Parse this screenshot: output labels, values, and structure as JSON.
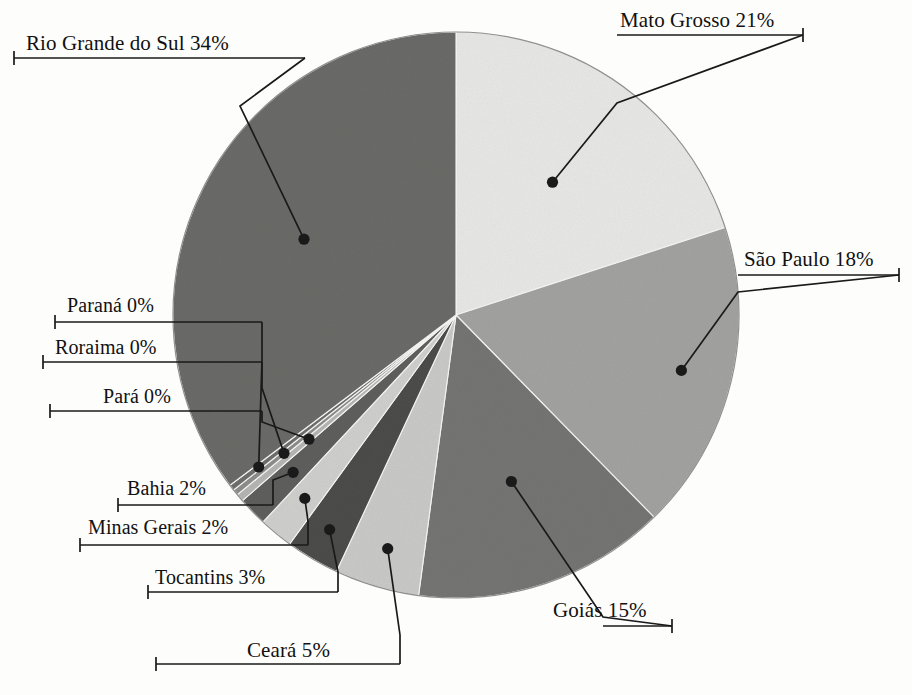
{
  "chart_data": {
    "type": "pie",
    "title": "",
    "subtitle": "",
    "xlabel": "",
    "ylabel": "",
    "legend_position": "none",
    "grid": false,
    "units": "percent",
    "label_format": "{name} {value}%",
    "start_angle_deg": 0,
    "direction": "clockwise",
    "center": {
      "x": 456,
      "y": 315
    },
    "radius": 283,
    "categories": [
      "Mato Grosso",
      "São Paulo",
      "Goiás",
      "Ceará",
      "Tocantins",
      "Minas Gerais",
      "Bahia",
      "Pará",
      "Roraima",
      "Paraná",
      "Rio Grande do Sul"
    ],
    "values": [
      21,
      18,
      15,
      5,
      3,
      2,
      2,
      0,
      0,
      0,
      34
    ],
    "colors": [
      "#e7e7e5",
      "#a2a2a0",
      "#757573",
      "#c9c9c7",
      "#4c4c4a",
      "#cfcfcd",
      "#5f5f5d",
      "#b5b5b3",
      "#8d8d8b",
      "#6e6e6c",
      "#6a6a68"
    ],
    "slices": [
      {
        "name": "Mato Grosso",
        "value": 21,
        "label": "Mato Grosso 21%",
        "color": "#e7e7e5",
        "sweep_deg": 72.0,
        "start_deg": 0.0
      },
      {
        "name": "São Paulo",
        "value": 18,
        "label": "São Paulo 18%",
        "color": "#a2a2a0",
        "sweep_deg": 63.6,
        "start_deg": 72.0
      },
      {
        "name": "Goiás",
        "value": 15,
        "label": "Goiás 15%",
        "color": "#757573",
        "sweep_deg": 52.0,
        "start_deg": 135.6
      },
      {
        "name": "Ceará",
        "value": 5,
        "label": "Ceará 5%",
        "color": "#c9c9c7",
        "sweep_deg": 17.4,
        "start_deg": 187.6
      },
      {
        "name": "Tocantins",
        "value": 3,
        "label": "Tocantins 3%",
        "color": "#4c4c4a",
        "sweep_deg": 11.0,
        "start_deg": 205.0
      },
      {
        "name": "Minas Gerais",
        "value": 2,
        "label": "Minas Gerais 2%",
        "color": "#cfcfcd",
        "sweep_deg": 7.0,
        "start_deg": 216.0
      },
      {
        "name": "Bahia",
        "value": 2,
        "label": "Bahia 2%",
        "color": "#5f5f5d",
        "sweep_deg": 6.0,
        "start_deg": 223.0
      },
      {
        "name": "Pará",
        "value": 0,
        "label": "Pará 0%",
        "color": "#b5b5b3",
        "sweep_deg": 1.6,
        "start_deg": 229.0
      },
      {
        "name": "Roraima",
        "value": 0,
        "label": "Roraima 0%",
        "color": "#8d8d8b",
        "sweep_deg": 1.2,
        "start_deg": 230.6
      },
      {
        "name": "Paraná",
        "value": 0,
        "label": "Paraná 0%",
        "color": "#6e6e6c",
        "sweep_deg": 1.2,
        "start_deg": 231.8
      },
      {
        "name": "Rio Grande do Sul",
        "value": 34,
        "label": "Rio Grande do Sul 34%",
        "color": "#6a6a68",
        "sweep_deg": 127.0,
        "start_deg": 233.0
      }
    ]
  },
  "labels": {
    "rio_grande_do_sul": "Rio Grande do Sul 34%",
    "mato_grosso": "Mato Grosso 21%",
    "sao_paulo": "São Paulo 18%",
    "goias": "Goiás 15%",
    "ceara": "Ceará 5%",
    "tocantins": "Tocantins 3%",
    "minas_gerais": "Minas Gerais 2%",
    "bahia": "Bahia 2%",
    "para": "Pará 0%",
    "roraima": "Roraima 0%",
    "parana": "Paraná 0%"
  },
  "style": {
    "background": "#fdfdfb",
    "leader_color": "#1a1a1a",
    "text_color": "#111111",
    "pie_outline": "#8a8a88"
  }
}
